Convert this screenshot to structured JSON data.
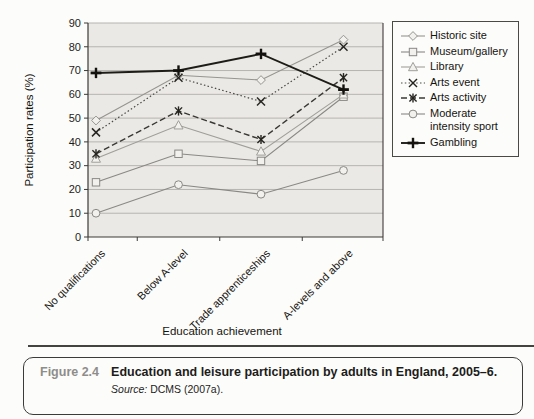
{
  "colors": {
    "plot_bg": "#ebe9e5",
    "grid": "#b6b4b0",
    "axis": "#3c3a37",
    "marker_fill": "#f3f1ee",
    "dark_marker": "#26241f"
  },
  "chart_data": {
    "type": "line",
    "categories": [
      "No qualifications",
      "Below A-level",
      "Trade apprenticeships",
      "A-levels and above"
    ],
    "series": [
      {
        "name": "Historic site",
        "marker": "diamond",
        "dash": "",
        "width": 1.1,
        "color": "#96948f",
        "values": [
          49,
          68,
          66,
          83
        ]
      },
      {
        "name": "Museum/gallery",
        "marker": "square",
        "dash": "",
        "width": 1.1,
        "color": "#8a8885",
        "values": [
          23,
          35,
          32,
          59
        ]
      },
      {
        "name": "Library",
        "marker": "triangle",
        "dash": "",
        "width": 1.1,
        "color": "#a09e99",
        "values": [
          33,
          47,
          36,
          60
        ]
      },
      {
        "name": "Arts event",
        "marker": "x",
        "dash": "1.5 2.3",
        "width": 1.2,
        "color": "#4a4845",
        "values": [
          44,
          67,
          57,
          80
        ]
      },
      {
        "name": "Arts activity",
        "marker": "asterisk",
        "dash": "6 3",
        "width": 1.4,
        "color": "#3a3835",
        "values": [
          35,
          53,
          41,
          67
        ]
      },
      {
        "name": "Moderate intensity sport",
        "marker": "circle",
        "dash": "",
        "width": 1.1,
        "color": "#8a8885",
        "values": [
          10,
          22,
          18,
          28
        ]
      },
      {
        "name": "Gambling",
        "marker": "plus",
        "dash": "",
        "width": 1.9,
        "color": "#1e1c17",
        "values": [
          69,
          70,
          77,
          62
        ]
      }
    ],
    "xlabel": "Education achievement",
    "ylabel": "Participation rates (%)",
    "ylim": [
      0,
      90
    ],
    "yticks": [
      0,
      10,
      20,
      30,
      40,
      50,
      60,
      70,
      80,
      90
    ],
    "grid": "horizontal",
    "legend_position": "right"
  },
  "caption": {
    "figure_label": "Figure 2.4",
    "text": "Education and leisure participation by adults in England, 2005–6.",
    "source_label": "Source:",
    "source_text": "DCMS (2007a)."
  }
}
